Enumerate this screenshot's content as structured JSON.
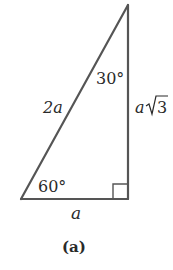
{
  "figure": {
    "caption": "(a)",
    "triangle": {
      "type": "right-triangle-30-60-90",
      "stroke_color": "#555555",
      "vertices": {
        "top": [
          128,
          5
        ],
        "bottom_left": [
          21,
          199
        ],
        "bottom_right": [
          128,
          199
        ]
      },
      "right_angle_marker": {
        "x": 113,
        "y": 184,
        "size": 15
      }
    },
    "labels": {
      "hypotenuse": "2a",
      "top_angle": "30°",
      "vertical_side_var": "a",
      "vertical_side_sqrt": "3",
      "bottom_angle": "60°",
      "base": "a"
    }
  }
}
